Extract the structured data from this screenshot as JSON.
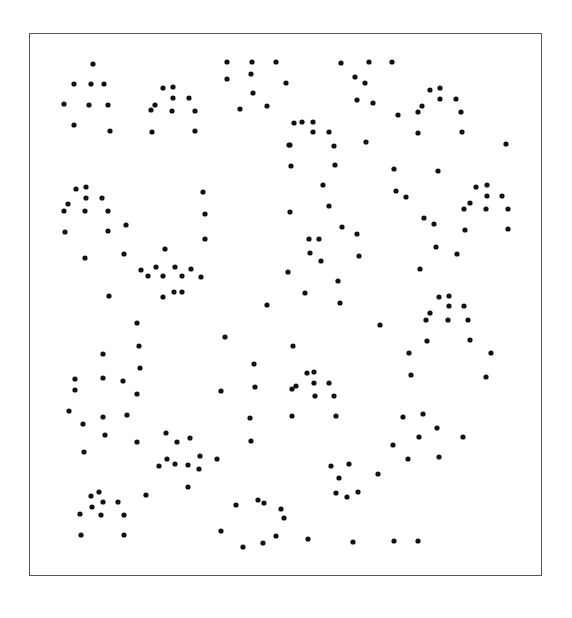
{
  "figure": {
    "type": "dot-pattern",
    "frame": {
      "x": 29,
      "y": 33,
      "width": 513,
      "height": 543,
      "border_color": "#555555"
    },
    "dot_color": "#111111",
    "dot_radius": 2.6,
    "dots": [
      [
        93,
        64
      ],
      [
        74,
        84
      ],
      [
        91,
        84
      ],
      [
        104,
        84
      ],
      [
        64,
        104
      ],
      [
        89,
        105
      ],
      [
        108,
        105
      ],
      [
        74,
        125
      ],
      [
        110,
        131
      ],
      [
        163,
        88
      ],
      [
        173,
        87
      ],
      [
        173,
        98
      ],
      [
        189,
        98
      ],
      [
        151,
        110
      ],
      [
        155,
        105
      ],
      [
        172,
        111
      ],
      [
        195,
        111
      ],
      [
        152,
        132
      ],
      [
        195,
        131
      ],
      [
        227,
        62
      ],
      [
        252,
        62
      ],
      [
        276,
        62
      ],
      [
        227,
        79
      ],
      [
        251,
        74
      ],
      [
        286,
        83
      ],
      [
        253,
        93
      ],
      [
        240,
        109
      ],
      [
        267,
        106
      ],
      [
        289,
        145
      ],
      [
        341,
        63
      ],
      [
        369,
        62
      ],
      [
        392,
        62
      ],
      [
        355,
        77
      ],
      [
        365,
        83
      ],
      [
        357,
        100
      ],
      [
        373,
        103
      ],
      [
        398,
        115
      ],
      [
        418,
        112
      ],
      [
        422,
        106
      ],
      [
        430,
        90
      ],
      [
        440,
        88
      ],
      [
        440,
        99
      ],
      [
        456,
        99
      ],
      [
        461,
        112
      ],
      [
        418,
        133
      ],
      [
        462,
        132
      ],
      [
        506,
        144
      ],
      [
        294,
        123
      ],
      [
        302,
        122
      ],
      [
        313,
        122
      ],
      [
        313,
        132
      ],
      [
        329,
        132
      ],
      [
        334,
        146
      ],
      [
        290,
        145
      ],
      [
        366,
        142
      ],
      [
        76,
        189
      ],
      [
        86,
        187
      ],
      [
        86,
        198
      ],
      [
        102,
        198
      ],
      [
        64,
        211
      ],
      [
        68,
        204
      ],
      [
        85,
        211
      ],
      [
        108,
        211
      ],
      [
        65,
        232
      ],
      [
        108,
        231
      ],
      [
        126,
        225
      ],
      [
        85,
        258
      ],
      [
        124,
        254
      ],
      [
        109,
        296
      ],
      [
        203,
        192
      ],
      [
        205,
        214
      ],
      [
        205,
        239
      ],
      [
        165,
        249
      ],
      [
        141,
        270
      ],
      [
        148,
        276
      ],
      [
        156,
        267
      ],
      [
        163,
        276
      ],
      [
        175,
        267
      ],
      [
        182,
        276
      ],
      [
        191,
        269
      ],
      [
        201,
        277
      ],
      [
        163,
        297
      ],
      [
        174,
        292
      ],
      [
        182,
        292
      ],
      [
        291,
        166
      ],
      [
        335,
        165
      ],
      [
        323,
        185
      ],
      [
        290,
        212
      ],
      [
        329,
        206
      ],
      [
        342,
        227
      ],
      [
        357,
        234
      ],
      [
        309,
        239
      ],
      [
        319,
        239
      ],
      [
        310,
        253
      ],
      [
        321,
        261
      ],
      [
        359,
        256
      ],
      [
        288,
        272
      ],
      [
        338,
        281
      ],
      [
        305,
        293
      ],
      [
        340,
        303
      ],
      [
        267,
        305
      ],
      [
        394,
        169
      ],
      [
        438,
        171
      ],
      [
        396,
        191
      ],
      [
        406,
        197
      ],
      [
        424,
        218
      ],
      [
        434,
        224
      ],
      [
        476,
        187
      ],
      [
        487,
        185
      ],
      [
        487,
        196
      ],
      [
        502,
        196
      ],
      [
        464,
        209
      ],
      [
        470,
        203
      ],
      [
        486,
        209
      ],
      [
        508,
        209
      ],
      [
        465,
        230
      ],
      [
        508,
        229
      ],
      [
        436,
        247
      ],
      [
        457,
        254
      ],
      [
        420,
        269
      ],
      [
        137,
        323
      ],
      [
        139,
        346
      ],
      [
        140,
        368
      ],
      [
        137,
        394
      ],
      [
        103,
        354
      ],
      [
        103,
        378
      ],
      [
        123,
        381
      ],
      [
        75,
        379
      ],
      [
        75,
        390
      ],
      [
        69,
        411
      ],
      [
        83,
        424
      ],
      [
        103,
        417
      ],
      [
        105,
        435
      ],
      [
        127,
        415
      ],
      [
        137,
        442
      ],
      [
        84,
        452
      ],
      [
        225,
        337
      ],
      [
        254,
        364
      ],
      [
        221,
        391
      ],
      [
        255,
        387
      ],
      [
        250,
        418
      ],
      [
        251,
        441
      ],
      [
        166,
        433
      ],
      [
        177,
        442
      ],
      [
        190,
        438
      ],
      [
        217,
        459
      ],
      [
        200,
        456
      ],
      [
        167,
        459
      ],
      [
        175,
        464
      ],
      [
        188,
        465
      ],
      [
        199,
        469
      ],
      [
        159,
        466
      ],
      [
        188,
        487
      ],
      [
        146,
        495
      ],
      [
        293,
        346
      ],
      [
        307,
        373
      ],
      [
        314,
        372
      ],
      [
        314,
        383
      ],
      [
        329,
        383
      ],
      [
        292,
        389
      ],
      [
        296,
        386
      ],
      [
        315,
        396
      ],
      [
        334,
        396
      ],
      [
        292,
        416
      ],
      [
        336,
        416
      ],
      [
        380,
        325
      ],
      [
        430,
        313
      ],
      [
        439,
        297
      ],
      [
        449,
        296
      ],
      [
        449,
        306
      ],
      [
        464,
        306
      ],
      [
        426,
        320
      ],
      [
        448,
        320
      ],
      [
        468,
        320
      ],
      [
        470,
        340
      ],
      [
        427,
        341
      ],
      [
        409,
        353
      ],
      [
        491,
        353
      ],
      [
        411,
        375
      ],
      [
        486,
        377
      ],
      [
        403,
        417
      ],
      [
        423,
        414
      ],
      [
        437,
        428
      ],
      [
        419,
        437
      ],
      [
        463,
        437
      ],
      [
        393,
        445
      ],
      [
        408,
        459
      ],
      [
        439,
        457
      ],
      [
        331,
        466
      ],
      [
        349,
        464
      ],
      [
        339,
        478
      ],
      [
        336,
        493
      ],
      [
        347,
        497
      ],
      [
        358,
        492
      ],
      [
        378,
        474
      ],
      [
        99,
        492
      ],
      [
        91,
        496
      ],
      [
        92,
        507
      ],
      [
        103,
        502
      ],
      [
        118,
        502
      ],
      [
        80,
        514
      ],
      [
        101,
        515
      ],
      [
        124,
        515
      ],
      [
        81,
        535
      ],
      [
        124,
        535
      ],
      [
        236,
        505
      ],
      [
        258,
        500
      ],
      [
        264,
        503
      ],
      [
        281,
        509
      ],
      [
        284,
        518
      ],
      [
        221,
        531
      ],
      [
        243,
        547
      ],
      [
        263,
        543
      ],
      [
        276,
        536
      ],
      [
        308,
        539
      ],
      [
        353,
        542
      ],
      [
        394,
        541
      ],
      [
        418,
        541
      ]
    ]
  }
}
